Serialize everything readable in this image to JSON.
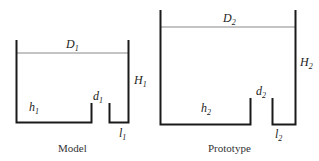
{
  "model": {
    "caption": "Model",
    "labels": {
      "D": {
        "base": "D",
        "sub": "1"
      },
      "H": {
        "base": "H",
        "sub": "1"
      },
      "h": {
        "base": "h",
        "sub": "1"
      },
      "d": {
        "base": "d",
        "sub": "1"
      },
      "l": {
        "base": "l",
        "sub": "1"
      }
    }
  },
  "prototype": {
    "caption": "Prototype",
    "labels": {
      "D": {
        "base": "D",
        "sub": "2"
      },
      "H": {
        "base": "H",
        "sub": "2"
      },
      "h": {
        "base": "h",
        "sub": "2"
      },
      "d": {
        "base": "d",
        "sub": "2"
      },
      "l": {
        "base": "l",
        "sub": "2"
      }
    }
  },
  "colors": {
    "wall": "#1a1a1a",
    "water_line": "#8a8a8a"
  }
}
